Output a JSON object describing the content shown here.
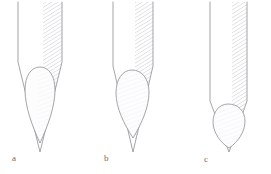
{
  "figure": {
    "background_color": "#ffffff",
    "outline_color": "#8a8a90",
    "hatch_color": "#b9b9c0",
    "pulp_fill_color": "#fbfbfc",
    "label_color": "#6e6e72",
    "width": 271,
    "height": 174
  },
  "panels": [
    {
      "id": "a",
      "label": "a",
      "label_x": 12,
      "label_y": 161,
      "root_outline_name": "root-outline-a",
      "pulp_cavity_name": "pulp-cavity-a",
      "hatch_region_name": "dentin-hatching-a",
      "root_left_x": 18,
      "root_right_x": 62,
      "root_top_y": 2,
      "apex_x": 40,
      "apex_y": 152,
      "shoulder_y": 62,
      "pulp_top_y": 67,
      "pulp_tip_y": 143,
      "hatch_left_x": 43
    },
    {
      "id": "b",
      "label": "b",
      "label_x": 104,
      "label_y": 161,
      "root_outline_name": "root-outline-b",
      "pulp_cavity_name": "pulp-cavity-b",
      "hatch_region_name": "dentin-hatching-b",
      "root_left_x": 113,
      "root_right_x": 153,
      "root_top_y": 2,
      "apex_x": 133,
      "apex_y": 152,
      "shoulder_y": 66,
      "pulp_top_y": 70,
      "pulp_tip_y": 138,
      "hatch_left_x": 135
    },
    {
      "id": "c",
      "label": "c",
      "label_x": 204,
      "label_y": 162,
      "root_outline_name": "root-outline-c",
      "pulp_cavity_name": "pulp-cavity-c",
      "hatch_region_name": "dentin-hatching-c",
      "root_left_x": 210,
      "root_right_x": 247,
      "root_top_y": 2,
      "apex_x": 229,
      "apex_y": 152,
      "shoulder_y": 101,
      "pulp_top_y": 104,
      "pulp_tip_y": 148,
      "hatch_left_x": 232
    }
  ]
}
